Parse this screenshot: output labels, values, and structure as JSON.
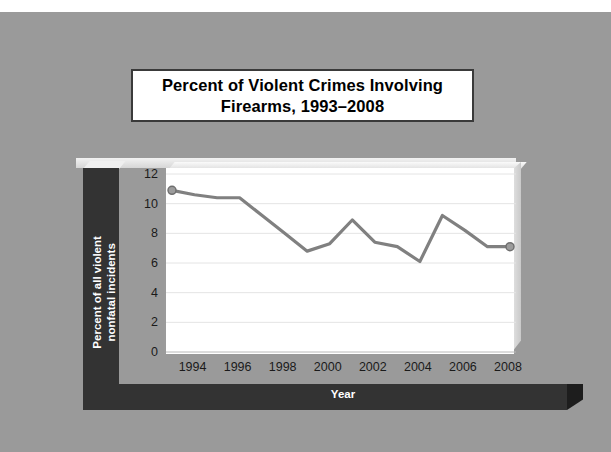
{
  "slide": {
    "background_color": "#9a9a9a",
    "title": "Percent of Violent Crimes Involving\nFirearms, 1993–2008",
    "title_line1": "Percent of Violent Crimes Involving",
    "title_line2": "Firearms, 1993–2008"
  },
  "chart_data": {
    "type": "line",
    "title": "Percent of Violent Crimes Involving Firearms, 1993–2008",
    "xlabel": "Year",
    "ylabel": "Percent of all violent nonfatal incidents",
    "ylabel_line1": "Percent of all violent",
    "ylabel_line2": "nonfatal incidents",
    "x": [
      1993,
      1994,
      1995,
      1996,
      1997,
      1998,
      1999,
      2000,
      2001,
      2002,
      2003,
      2004,
      2005,
      2006,
      2007,
      2008
    ],
    "values": [
      10.9,
      10.6,
      10.4,
      10.4,
      9.2,
      8.0,
      6.8,
      7.3,
      8.9,
      7.4,
      7.1,
      6.1,
      9.2,
      8.2,
      7.1,
      7.1
    ],
    "series": [
      {
        "name": "Percent of all violent nonfatal incidents",
        "color": "#808080",
        "values": [
          10.9,
          10.6,
          10.4,
          10.4,
          9.2,
          8.0,
          6.8,
          7.3,
          8.9,
          7.4,
          7.1,
          6.1,
          9.2,
          8.2,
          7.1,
          7.1
        ]
      }
    ],
    "ylim": [
      0,
      12
    ],
    "yticks": [
      0,
      2,
      4,
      6,
      8,
      10,
      12
    ],
    "ytick_labels": [
      "0",
      "2",
      "4",
      "6",
      "8",
      "10",
      "12"
    ],
    "xlim": [
      1993,
      2008
    ],
    "xticks": [
      1994,
      1996,
      1998,
      2000,
      2002,
      2004,
      2006,
      2008
    ],
    "xtick_labels": [
      "1994",
      "1996",
      "1998",
      "2000",
      "2002",
      "2004",
      "2006",
      "2008"
    ],
    "grid": "horizontal",
    "gridline_color": "#e4e4e4",
    "legend": "none",
    "markers": [
      "start",
      "end"
    ],
    "line_color": "#808080",
    "plot_background": "#ffffff",
    "axis_band_color": "#333333",
    "axis_band_text_color": "#ffffff"
  }
}
